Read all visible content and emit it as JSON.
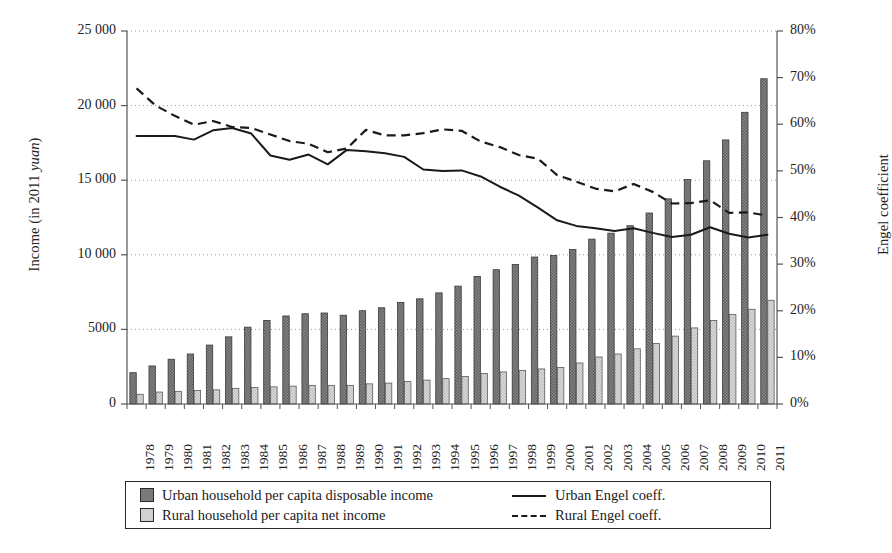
{
  "axes": {
    "y_left_title_prefix": "Income (in 2011 ",
    "y_left_title_italic": "yuan",
    "y_left_title_suffix": ")",
    "y_right_title": "Engel coefficient",
    "y_left_ticks": [
      "25 000",
      "20 000",
      "15 000",
      "10 000",
      "5000",
      "0"
    ],
    "y_left_values": [
      25000,
      20000,
      15000,
      10000,
      5000,
      0
    ],
    "y_right_ticks": [
      "80%",
      "70%",
      "60%",
      "50%",
      "40%",
      "30%",
      "20%",
      "10%",
      "0%"
    ],
    "y_right_values": [
      80,
      70,
      60,
      50,
      40,
      30,
      20,
      10,
      0
    ]
  },
  "legend": {
    "items": [
      {
        "key": "urban-income",
        "label": "Urban household per capita disposable income",
        "marker": "bar-dark",
        "color": "#7a7a7a"
      },
      {
        "key": "rural-income",
        "label": "Rural household per capita net income",
        "marker": "bar-light",
        "color": "#d0d0d0"
      },
      {
        "key": "urban-engel",
        "label": "Urban Engel coeff.",
        "marker": "line-solid",
        "color": "#1a1a1a"
      },
      {
        "key": "rural-engel",
        "label": "Rural Engel coeff.",
        "marker": "line-dashed",
        "color": "#1a1a1a"
      }
    ]
  },
  "chart_data": {
    "type": "bar",
    "title": "",
    "xlabel": "",
    "ylabel": "Income (in 2011 yuan)",
    "y2label": "Engel coefficient",
    "ylim": [
      0,
      25000
    ],
    "y2lim": [
      0,
      80
    ],
    "grid": true,
    "legend_position": "bottom",
    "categories": [
      "1978",
      "1979",
      "1980",
      "1981",
      "1982",
      "1983",
      "1984",
      "1985",
      "1986",
      "1987",
      "1988",
      "1989",
      "1990",
      "1991",
      "1992",
      "1993",
      "1994",
      "1995",
      "1996",
      "1997",
      "1998",
      "1999",
      "2000",
      "2001",
      "2002",
      "2003",
      "2004",
      "2005",
      "2006",
      "2007",
      "2008",
      "2009",
      "2010",
      "2011"
    ],
    "series": [
      {
        "name": "Urban household per capita disposable income",
        "axis": "left",
        "unit": "2011 yuan",
        "type": "bar",
        "color": "#7a7a7a",
        "values": [
          2100,
          2550,
          3000,
          3350,
          3950,
          4500,
          5150,
          5600,
          5900,
          6050,
          6100,
          5950,
          6250,
          6450,
          6800,
          7050,
          7450,
          7900,
          8550,
          9000,
          9350,
          9850,
          9950,
          10350,
          11050,
          11450,
          11950,
          12800,
          13750,
          15050,
          16300,
          17700,
          19550,
          21800
        ]
      },
      {
        "name": "Rural household per capita net income",
        "axis": "left",
        "unit": "2011 yuan",
        "type": "bar",
        "color": "#d0d0d0",
        "values": [
          650,
          800,
          850,
          900,
          950,
          1050,
          1100,
          1150,
          1200,
          1250,
          1250,
          1250,
          1350,
          1400,
          1500,
          1600,
          1700,
          1850,
          2050,
          2150,
          2250,
          2350,
          2450,
          2750,
          3150,
          3350,
          3700,
          4050,
          4550,
          5100,
          5600,
          6000,
          6350,
          6950
        ]
      },
      {
        "name": "Urban Engel coeff.",
        "axis": "right",
        "unit": "%",
        "type": "line",
        "style": "solid",
        "color": "#1a1a1a",
        "values": [
          57.5,
          57.5,
          57.5,
          56.7,
          58.7,
          59.2,
          58.0,
          53.3,
          52.4,
          53.5,
          51.4,
          54.5,
          54.2,
          53.8,
          53.0,
          50.3,
          50.0,
          50.1,
          48.8,
          46.6,
          44.7,
          42.1,
          39.4,
          38.2,
          37.7,
          37.1,
          37.7,
          36.7,
          35.8,
          36.3,
          37.9,
          36.5,
          35.7,
          36.3
        ]
      },
      {
        "name": "Rural Engel coeff.",
        "axis": "right",
        "unit": "%",
        "type": "line",
        "style": "dashed",
        "color": "#1a1a1a",
        "values": [
          67.7,
          64.0,
          61.8,
          59.9,
          60.7,
          59.4,
          59.2,
          57.8,
          56.4,
          55.8,
          54.0,
          54.8,
          58.8,
          57.6,
          57.6,
          58.1,
          58.9,
          58.6,
          56.3,
          55.1,
          53.4,
          52.6,
          49.1,
          47.7,
          46.2,
          45.6,
          47.2,
          45.5,
          43.0,
          43.1,
          43.7,
          41.0,
          41.1,
          40.4
        ]
      }
    ]
  }
}
